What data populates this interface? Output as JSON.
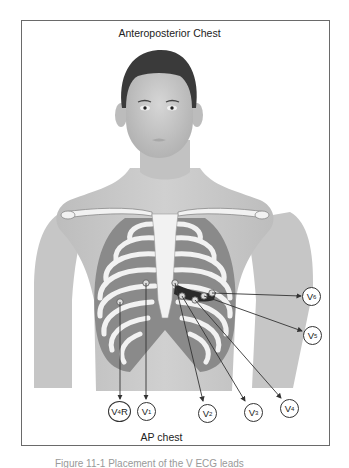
{
  "diagram": {
    "title": "Anteroposterior Chest",
    "footer_label": "AP chest",
    "caption_partial": "Figure 11-1  Placement of the V ECG leads",
    "colors": {
      "frame": "#6a6a6a",
      "skin": "#c8c8c8",
      "skin_dark": "#b4b4b4",
      "hair": "#3a3a3a",
      "rib": "#f2f2f2",
      "intercostal": "#8a8a8a",
      "arrow": "#333333"
    },
    "leads": [
      {
        "id": "V4R",
        "base": "V",
        "sub": "4",
        "suffix": "R",
        "cx": 119,
        "cy": 411
      },
      {
        "id": "V1",
        "base": "V",
        "sub": "1",
        "suffix": "",
        "cx": 146,
        "cy": 411
      },
      {
        "id": "V2",
        "base": "V",
        "sub": "2",
        "suffix": "",
        "cx": 207,
        "cy": 413
      },
      {
        "id": "V3",
        "base": "V",
        "sub": "3",
        "suffix": "",
        "cx": 253,
        "cy": 412
      },
      {
        "id": "V4",
        "base": "V",
        "sub": "4",
        "suffix": "",
        "cx": 289,
        "cy": 408
      },
      {
        "id": "V5",
        "base": "V",
        "sub": "5",
        "suffix": "",
        "cx": 313,
        "cy": 335
      },
      {
        "id": "V6",
        "base": "V",
        "sub": "6",
        "suffix": "",
        "cx": 312,
        "cy": 296
      }
    ],
    "electrodes": [
      {
        "lead": "V4R",
        "x": 120,
        "y": 302
      },
      {
        "lead": "V1",
        "x": 146,
        "y": 283
      },
      {
        "lead": "V2",
        "x": 175,
        "y": 283
      },
      {
        "lead": "V3",
        "x": 182,
        "y": 296
      },
      {
        "lead": "V4",
        "x": 195,
        "y": 300
      },
      {
        "lead": "V5",
        "x": 204,
        "y": 296
      },
      {
        "lead": "V6",
        "x": 212,
        "y": 293
      }
    ]
  }
}
